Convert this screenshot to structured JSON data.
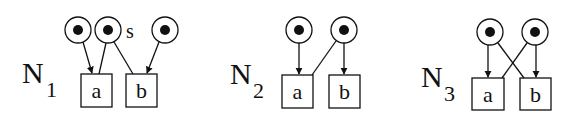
{
  "diagram": {
    "type": "petri-nets",
    "colors": {
      "stroke": "#111111",
      "background": "#ffffff",
      "token": "#111111"
    },
    "nets": [
      {
        "id": "N1",
        "label_main": "N",
        "label_sub": "1",
        "places": [
          {
            "id": "p1",
            "marked": true,
            "label": ""
          },
          {
            "id": "p2",
            "marked": true,
            "label": "s"
          },
          {
            "id": "p3",
            "marked": true,
            "label": ""
          }
        ],
        "transitions": [
          {
            "id": "a",
            "label": "a"
          },
          {
            "id": "b",
            "label": "b"
          }
        ],
        "arcs": [
          {
            "from": "p1",
            "to": "a",
            "arrow": true
          },
          {
            "from": "p2",
            "to": "a",
            "arrow": false
          },
          {
            "from": "p2",
            "to": "b",
            "arrow": false
          },
          {
            "from": "p3",
            "to": "b",
            "arrow": true
          }
        ]
      },
      {
        "id": "N2",
        "label_main": "N",
        "label_sub": "2",
        "places": [
          {
            "id": "p1",
            "marked": true,
            "label": ""
          },
          {
            "id": "p2",
            "marked": true,
            "label": ""
          }
        ],
        "transitions": [
          {
            "id": "a",
            "label": "a"
          },
          {
            "id": "b",
            "label": "b"
          }
        ],
        "arcs": [
          {
            "from": "p1",
            "to": "a",
            "arrow": true
          },
          {
            "from": "p2",
            "to": "a",
            "arrow": false
          },
          {
            "from": "p2",
            "to": "b",
            "arrow": true
          }
        ]
      },
      {
        "id": "N3",
        "label_main": "N",
        "label_sub": "3",
        "places": [
          {
            "id": "p1",
            "marked": true,
            "label": ""
          },
          {
            "id": "p2",
            "marked": true,
            "label": ""
          }
        ],
        "transitions": [
          {
            "id": "a",
            "label": "a"
          },
          {
            "id": "b",
            "label": "b"
          }
        ],
        "arcs": [
          {
            "from": "p1",
            "to": "a",
            "arrow": true
          },
          {
            "from": "p1",
            "to": "b",
            "arrow": false
          },
          {
            "from": "p2",
            "to": "a",
            "arrow": false
          },
          {
            "from": "p2",
            "to": "b",
            "arrow": true
          }
        ]
      }
    ]
  }
}
